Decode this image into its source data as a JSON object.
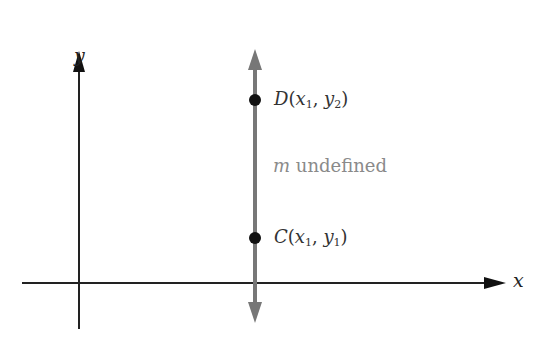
{
  "diagram": {
    "axes": {
      "x_label": "x",
      "y_label": "y",
      "color": "#222222"
    },
    "vertical_line": {
      "color": "#777777",
      "description": "vertical line through C and D"
    },
    "points": [
      {
        "name": "D",
        "open": "(",
        "x": "x",
        "x_sub": "1",
        "sep": ", ",
        "y": "y",
        "y_sub": "2",
        "close": ")"
      },
      {
        "name": "C",
        "open": "(",
        "x": "x",
        "x_sub": "1",
        "sep": ", ",
        "y": "y",
        "y_sub": "1",
        "close": ")"
      }
    ],
    "slope_note": {
      "var": "m",
      "text": " undefined"
    },
    "point_color": "#111111"
  }
}
